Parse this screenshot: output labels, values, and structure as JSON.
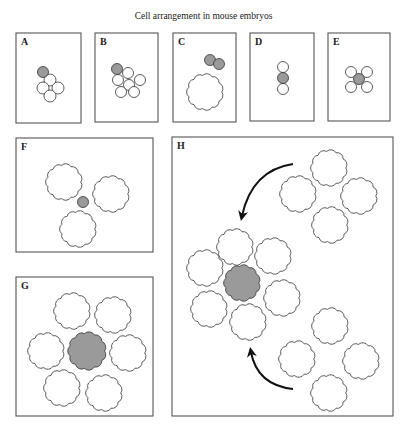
{
  "title": "Cell arrangement in mouse embryos",
  "colors": {
    "stroke": "#333333",
    "gray_cell": "#9a9a9a",
    "white_cell": "#ffffff",
    "frame": "#555555"
  },
  "panels": [
    {
      "label": "A",
      "x": 16,
      "y": 33,
      "w": 65,
      "h": 90,
      "cells": [
        {
          "type": "circle",
          "cx": 50,
          "cy": 80,
          "r": 6,
          "fill": "white"
        },
        {
          "type": "circle",
          "cx": 43,
          "cy": 88,
          "r": 6,
          "fill": "white"
        },
        {
          "type": "circle",
          "cx": 58,
          "cy": 88,
          "r": 6,
          "fill": "white"
        },
        {
          "type": "circle",
          "cx": 50,
          "cy": 96,
          "r": 6,
          "fill": "white"
        },
        {
          "type": "circle",
          "cx": 43,
          "cy": 72,
          "r": 5.5,
          "fill": "gray"
        }
      ]
    },
    {
      "label": "B",
      "x": 95,
      "y": 33,
      "w": 63,
      "h": 89,
      "cells": [
        {
          "type": "circle",
          "cx": 128,
          "cy": 73,
          "r": 5.5,
          "fill": "white"
        },
        {
          "type": "circle",
          "cx": 118,
          "cy": 80,
          "r": 5.5,
          "fill": "white"
        },
        {
          "type": "circle",
          "cx": 129,
          "cy": 85,
          "r": 5.5,
          "fill": "white"
        },
        {
          "type": "circle",
          "cx": 140,
          "cy": 80,
          "r": 5.5,
          "fill": "white"
        },
        {
          "type": "circle",
          "cx": 121,
          "cy": 92,
          "r": 5.5,
          "fill": "white"
        },
        {
          "type": "circle",
          "cx": 134,
          "cy": 92,
          "r": 5.5,
          "fill": "white"
        },
        {
          "type": "circle",
          "cx": 117,
          "cy": 69,
          "r": 5.5,
          "fill": "gray"
        }
      ]
    },
    {
      "label": "C",
      "x": 173,
      "y": 33,
      "w": 63,
      "h": 89,
      "cells": [
        {
          "type": "scallop",
          "cx": 205,
          "cy": 92,
          "r": 20,
          "fill": "white"
        },
        {
          "type": "circle",
          "cx": 210,
          "cy": 60,
          "r": 5.5,
          "fill": "gray"
        },
        {
          "type": "circle",
          "cx": 219,
          "cy": 64,
          "r": 5.5,
          "fill": "gray"
        }
      ]
    },
    {
      "label": "D",
      "x": 250,
      "y": 33,
      "w": 64,
      "h": 88,
      "cells": [
        {
          "type": "circle",
          "cx": 283,
          "cy": 67,
          "r": 5.5,
          "fill": "white"
        },
        {
          "type": "circle",
          "cx": 283,
          "cy": 89,
          "r": 5.5,
          "fill": "white"
        },
        {
          "type": "circle",
          "cx": 283,
          "cy": 78,
          "r": 5.5,
          "fill": "gray"
        }
      ]
    },
    {
      "label": "E",
      "x": 328,
      "y": 33,
      "w": 62,
      "h": 88,
      "cells": [
        {
          "type": "circle",
          "cx": 351,
          "cy": 72,
          "r": 5.5,
          "fill": "white"
        },
        {
          "type": "circle",
          "cx": 367,
          "cy": 72,
          "r": 5.5,
          "fill": "white"
        },
        {
          "type": "circle",
          "cx": 351,
          "cy": 87,
          "r": 5.5,
          "fill": "white"
        },
        {
          "type": "circle",
          "cx": 367,
          "cy": 87,
          "r": 5.5,
          "fill": "white"
        },
        {
          "type": "circle",
          "cx": 359,
          "cy": 79,
          "r": 5.5,
          "fill": "gray"
        }
      ]
    },
    {
      "label": "F",
      "x": 16,
      "y": 138,
      "w": 137,
      "h": 114,
      "cells": [
        {
          "type": "scallop",
          "cx": 64,
          "cy": 182,
          "r": 20,
          "fill": "white"
        },
        {
          "type": "scallop",
          "cx": 111,
          "cy": 194,
          "r": 20,
          "fill": "white"
        },
        {
          "type": "scallop",
          "cx": 78,
          "cy": 229,
          "r": 20,
          "fill": "white"
        },
        {
          "type": "circle",
          "cx": 83,
          "cy": 202,
          "r": 5.5,
          "fill": "gray"
        }
      ]
    },
    {
      "label": "G",
      "x": 16,
      "y": 277,
      "w": 137,
      "h": 139,
      "cells": [
        {
          "type": "scallop",
          "cx": 72,
          "cy": 311,
          "r": 20,
          "fill": "white"
        },
        {
          "type": "scallop",
          "cx": 113,
          "cy": 315,
          "r": 20,
          "fill": "white"
        },
        {
          "type": "scallop",
          "cx": 46,
          "cy": 351,
          "r": 20,
          "fill": "white"
        },
        {
          "type": "scallop",
          "cx": 128,
          "cy": 353,
          "r": 20,
          "fill": "white"
        },
        {
          "type": "scallop",
          "cx": 62,
          "cy": 388,
          "r": 20,
          "fill": "white"
        },
        {
          "type": "scallop",
          "cx": 104,
          "cy": 393,
          "r": 20,
          "fill": "white"
        },
        {
          "type": "scallop",
          "cx": 87,
          "cy": 351,
          "r": 21,
          "fill": "gray"
        }
      ]
    },
    {
      "label": "H",
      "x": 172,
      "y": 137,
      "w": 221,
      "h": 279,
      "cells": [
        {
          "type": "scallop",
          "cx": 329,
          "cy": 168,
          "r": 20,
          "fill": "white"
        },
        {
          "type": "scallop",
          "cx": 298,
          "cy": 194,
          "r": 20,
          "fill": "white"
        },
        {
          "type": "scallop",
          "cx": 359,
          "cy": 196,
          "r": 20,
          "fill": "white"
        },
        {
          "type": "scallop",
          "cx": 330,
          "cy": 225,
          "r": 20,
          "fill": "white"
        },
        {
          "type": "scallop",
          "cx": 235,
          "cy": 247,
          "r": 20,
          "fill": "white"
        },
        {
          "type": "scallop",
          "cx": 273,
          "cy": 256,
          "r": 20,
          "fill": "white"
        },
        {
          "type": "scallop",
          "cx": 205,
          "cy": 268,
          "r": 20,
          "fill": "white"
        },
        {
          "type": "scallop",
          "cx": 282,
          "cy": 298,
          "r": 20,
          "fill": "white"
        },
        {
          "type": "scallop",
          "cx": 209,
          "cy": 309,
          "r": 20,
          "fill": "white"
        },
        {
          "type": "scallop",
          "cx": 248,
          "cy": 322,
          "r": 20,
          "fill": "white"
        },
        {
          "type": "scallop",
          "cx": 242,
          "cy": 283,
          "r": 20,
          "fill": "gray"
        },
        {
          "type": "scallop",
          "cx": 330,
          "cy": 326,
          "r": 20,
          "fill": "white"
        },
        {
          "type": "scallop",
          "cx": 297,
          "cy": 359,
          "r": 20,
          "fill": "white"
        },
        {
          "type": "scallop",
          "cx": 361,
          "cy": 361,
          "r": 20,
          "fill": "white"
        },
        {
          "type": "scallop",
          "cx": 329,
          "cy": 393,
          "r": 20,
          "fill": "white"
        }
      ],
      "arrows": [
        {
          "name": "arrow-top",
          "path": "M 293 164 Q 252 170 242 216",
          "head": {
            "x": 241,
            "y": 218,
            "angle": 95
          }
        },
        {
          "name": "arrow-bottom",
          "path": "M 293 389 Q 257 385 251 352",
          "head": {
            "x": 251,
            "y": 349,
            "angle": -95
          }
        }
      ]
    }
  ]
}
